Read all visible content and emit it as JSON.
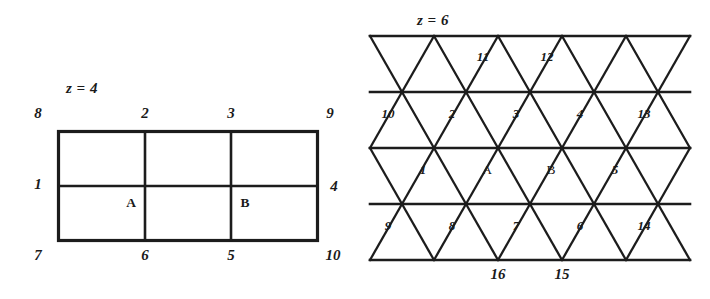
{
  "figure": {
    "caption_left": "z = 4",
    "caption_right": "z = 6",
    "ink_color": "#1c1c1c",
    "background_color": "#ffffff"
  },
  "square_lattice": {
    "title": "z = 4",
    "columns": 3,
    "rows": 2,
    "node_labels": {
      "top_left": "8",
      "top_mid_1": "2",
      "top_mid_2": "3",
      "top_right": "9",
      "left": "1",
      "right": "4",
      "bottom_left": "7",
      "bottom_mid_1": "6",
      "bottom_mid_2": "5",
      "bottom_right": "10"
    },
    "cell_labels": {
      "a": "A",
      "b": "B"
    }
  },
  "triangular_lattice": {
    "title": "z = 6",
    "rows": 4,
    "row1_labels": [
      "11",
      "12"
    ],
    "row2_labels": [
      "10",
      "2",
      "3",
      "4",
      "13"
    ],
    "row3_labels": [
      "1",
      "A",
      "B",
      "5"
    ],
    "row4_labels": [
      "9",
      "8",
      "7",
      "6",
      "14"
    ],
    "bottom_labels": [
      "16",
      "15"
    ]
  }
}
